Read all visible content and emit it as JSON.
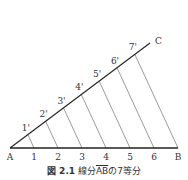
{
  "diagram": {
    "points": {
      "A": {
        "label": "A",
        "x": 10,
        "y": 148
      },
      "B": {
        "label": "B",
        "x": 178,
        "y": 148
      },
      "C": {
        "label": "C",
        "x": 150,
        "y": 43
      }
    },
    "base_divisions": [
      "1",
      "2",
      "3",
      "4",
      "5",
      "6"
    ],
    "ray_divisions": [
      "1'",
      "2'",
      "3'",
      "4'",
      "5'",
      "6'",
      "7'"
    ],
    "parts": 7
  },
  "caption": {
    "figure_label": "図 2.1",
    "text_prefix": "線分",
    "segment": "AB",
    "text_suffix": "の7等分"
  }
}
